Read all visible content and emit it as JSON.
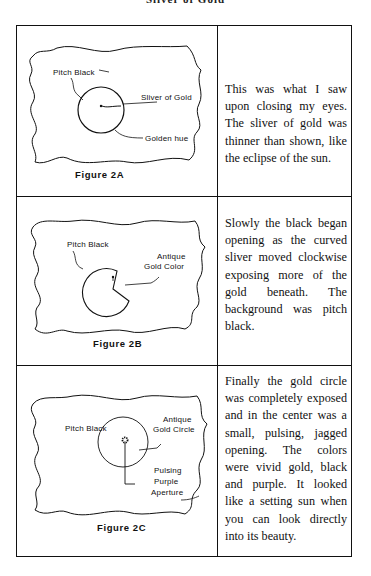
{
  "page": {
    "running_head": "Sliver of Gold"
  },
  "table": {
    "rows": [
      {
        "figure": {
          "caption": "Figure 2A",
          "labels": {
            "pitch_black": "Pitch Black",
            "sliver_of_gold": "Sliver of Gold",
            "golden_hue": "Golden hue"
          }
        },
        "text": "This was what I saw upon closing my eyes. The sliver of gold was thinner than shown, like the eclipse of the sun."
      },
      {
        "figure": {
          "caption": "Figure 2B",
          "labels": {
            "pitch_black": "Pitch Black",
            "antique_line1": "Antique",
            "antique_line2": "Gold Color"
          }
        },
        "text": "Slowly the black began opening as the curved sliver moved clockwise exposing more of the gold beneath. The background was pitch black."
      },
      {
        "figure": {
          "caption": "Figure 2C",
          "labels": {
            "pitch_black": "Pitch Black",
            "antique_line1": "Antique",
            "antique_line2": "Gold Circle",
            "pulsing_line1": "Pulsing",
            "pulsing_line2": "Purple",
            "pulsing_line3": "Aperture"
          }
        },
        "text": "Finally the gold circle was completely exposed and in the center was a small, pulsing, jagged opening. The colors were vivid gold, black and purple. It looked like a setting sun when you can look directly into its beauty."
      }
    ]
  }
}
